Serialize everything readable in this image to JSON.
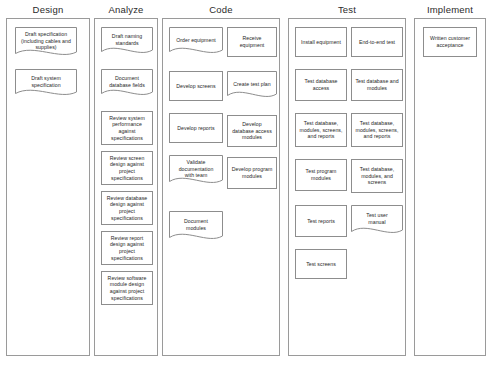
{
  "diagram": {
    "shape_legend": {
      "rect": "process-box",
      "doc": "document-box"
    },
    "columns": [
      {
        "id": "design",
        "header": "Design",
        "lanes": [
          {
            "id": "design-lane-1",
            "nodes": [
              {
                "id": "draft-specification",
                "label": "Draft specification (including cables and supplies)",
                "shape": "doc"
              },
              {
                "id": "draft-system-specification",
                "label": "Draft system specification",
                "shape": "doc"
              }
            ]
          }
        ]
      },
      {
        "id": "analyze",
        "header": "Analyze",
        "lanes": [
          {
            "id": "analyze-lane-1",
            "nodes": [
              {
                "id": "draft-naming-standards",
                "label": "Draft naming standards",
                "shape": "doc"
              },
              {
                "id": "document-database-fields",
                "label": "Document database fields",
                "shape": "doc"
              },
              {
                "id": "review-system-performance",
                "label": "Review system performance against specifications",
                "shape": "rect"
              },
              {
                "id": "review-screen-design",
                "label": "Review screen design against project specifications",
                "shape": "rect"
              },
              {
                "id": "review-database-design",
                "label": "Review database design against project specifications",
                "shape": "rect"
              },
              {
                "id": "review-report-design",
                "label": "Review report design against project specifications",
                "shape": "rect"
              },
              {
                "id": "review-software-module-design",
                "label": "Review software module design against project specifications",
                "shape": "rect"
              }
            ]
          }
        ]
      },
      {
        "id": "code",
        "header": "Code",
        "lanes": [
          {
            "id": "code-lane-1",
            "nodes": [
              {
                "id": "order-equipment",
                "label": "Order equipment",
                "shape": "doc"
              },
              {
                "id": "develop-screens",
                "label": "Develop screens",
                "shape": "rect"
              },
              {
                "id": "develop-reports",
                "label": "Develop reports",
                "shape": "rect"
              },
              {
                "id": "validate-documentation-with-team",
                "label": "Validate documentation with team",
                "shape": "doc"
              },
              {
                "id": "document-modules",
                "label": "Document modules",
                "shape": "doc"
              }
            ]
          },
          {
            "id": "code-lane-2",
            "nodes": [
              {
                "id": "receive-equipment",
                "label": "Receive equipment",
                "shape": "rect"
              },
              {
                "id": "create-test-plan",
                "label": "Create test plan",
                "shape": "doc"
              },
              {
                "id": "develop-database-access-modules",
                "label": "Develop database access modules",
                "shape": "rect"
              },
              {
                "id": "develop-program-modules",
                "label": "Develop program modules",
                "shape": "rect"
              }
            ]
          }
        ]
      },
      {
        "id": "test",
        "header": "Test",
        "lanes": [
          {
            "id": "test-lane-1",
            "nodes": [
              {
                "id": "install-equipment",
                "label": "Install equipment",
                "shape": "rect"
              },
              {
                "id": "test-database-access",
                "label": "Test database access",
                "shape": "rect"
              },
              {
                "id": "test-database-modules-screens-and-reports-1",
                "label": "Test database, modules, screens, and reports",
                "shape": "rect"
              },
              {
                "id": "test-program-modules",
                "label": "Test program modules",
                "shape": "rect"
              },
              {
                "id": "test-reports",
                "label": "Test reports",
                "shape": "rect"
              },
              {
                "id": "test-screens",
                "label": "Test screens",
                "shape": "rect"
              }
            ]
          },
          {
            "id": "test-lane-2",
            "nodes": [
              {
                "id": "end-to-end-test",
                "label": "End-to-end test",
                "shape": "rect"
              },
              {
                "id": "test-database-and-modules",
                "label": "Test database and modules",
                "shape": "rect"
              },
              {
                "id": "test-database-modules-screens-and-reports-2",
                "label": "Test database, modules, screens, and reports",
                "shape": "rect"
              },
              {
                "id": "test-database-modules-and-screens",
                "label": "Test database, modules, and screens",
                "shape": "rect"
              },
              {
                "id": "test-user-manual",
                "label": "Test user manual",
                "shape": "doc"
              }
            ]
          }
        ]
      },
      {
        "id": "implement",
        "header": "Implement",
        "lanes": [
          {
            "id": "implement-lane-1",
            "nodes": [
              {
                "id": "written-customer-acceptance",
                "label": "Written customer acceptance",
                "shape": "rect"
              }
            ]
          }
        ]
      }
    ]
  },
  "layout": {
    "columns": [
      {
        "id": "design",
        "x": 6,
        "width": 84
      },
      {
        "id": "analyze",
        "x": 94,
        "width": 64
      },
      {
        "id": "code",
        "x": 162,
        "width": 118
      },
      {
        "id": "test",
        "x": 288,
        "width": 118
      },
      {
        "id": "implement",
        "x": 414,
        "width": 72
      }
    ],
    "nodes": {
      "draft-specification": {
        "x": 8,
        "y": 8,
        "w": 62,
        "h": 34
      },
      "draft-system-specification": {
        "x": 8,
        "y": 50,
        "w": 62,
        "h": 32
      },
      "draft-naming-standards": {
        "x": 6,
        "y": 8,
        "w": 52,
        "h": 32
      },
      "document-database-fields": {
        "x": 6,
        "y": 50,
        "w": 52,
        "h": 32
      },
      "review-system-performance": {
        "x": 6,
        "y": 92,
        "w": 52,
        "h": 34
      },
      "review-screen-design": {
        "x": 6,
        "y": 132,
        "w": 52,
        "h": 34
      },
      "review-database-design": {
        "x": 6,
        "y": 172,
        "w": 52,
        "h": 34
      },
      "review-report-design": {
        "x": 6,
        "y": 212,
        "w": 52,
        "h": 34
      },
      "review-software-module-design": {
        "x": 6,
        "y": 252,
        "w": 52,
        "h": 34
      },
      "order-equipment": {
        "x": 6,
        "y": 8,
        "w": 54,
        "h": 32
      },
      "develop-screens": {
        "x": 6,
        "y": 52,
        "w": 54,
        "h": 30
      },
      "develop-reports": {
        "x": 6,
        "y": 94,
        "w": 54,
        "h": 30
      },
      "validate-documentation-with-team": {
        "x": 6,
        "y": 136,
        "w": 54,
        "h": 34
      },
      "document-modules": {
        "x": 6,
        "y": 192,
        "w": 54,
        "h": 34
      },
      "receive-equipment": {
        "x": 64,
        "y": 8,
        "w": 50,
        "h": 30
      },
      "create-test-plan": {
        "x": 64,
        "y": 52,
        "w": 50,
        "h": 32
      },
      "develop-database-access-modules": {
        "x": 64,
        "y": 96,
        "w": 50,
        "h": 32
      },
      "develop-program-modules": {
        "x": 64,
        "y": 138,
        "w": 50,
        "h": 32
      },
      "install-equipment": {
        "x": 6,
        "y": 8,
        "w": 52,
        "h": 30
      },
      "test-database-access": {
        "x": 6,
        "y": 50,
        "w": 52,
        "h": 32
      },
      "test-database-modules-screens-and-reports-1": {
        "x": 6,
        "y": 94,
        "w": 52,
        "h": 34
      },
      "test-program-modules": {
        "x": 6,
        "y": 140,
        "w": 52,
        "h": 32
      },
      "test-reports": {
        "x": 6,
        "y": 186,
        "w": 52,
        "h": 32
      },
      "test-screens": {
        "x": 6,
        "y": 230,
        "w": 52,
        "h": 30
      },
      "end-to-end-test": {
        "x": 62,
        "y": 8,
        "w": 52,
        "h": 30
      },
      "test-database-and-modules": {
        "x": 62,
        "y": 50,
        "w": 52,
        "h": 32
      },
      "test-database-modules-screens-and-reports-2": {
        "x": 62,
        "y": 94,
        "w": 52,
        "h": 34
      },
      "test-database-modules-and-screens": {
        "x": 62,
        "y": 140,
        "w": 52,
        "h": 34
      },
      "test-user-manual": {
        "x": 62,
        "y": 186,
        "w": 52,
        "h": 34
      },
      "written-customer-acceptance": {
        "x": 8,
        "y": 8,
        "w": 54,
        "h": 30
      }
    }
  }
}
